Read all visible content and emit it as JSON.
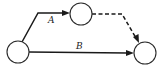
{
  "diagram": {
    "type": "network",
    "colors": {
      "stroke": "#1a1a1a",
      "background": "#ffffff"
    },
    "nodes": [
      {
        "id": "start",
        "cx": 18,
        "cy": 52,
        "r": 11
      },
      {
        "id": "mid",
        "cx": 81,
        "cy": 14,
        "r": 11
      },
      {
        "id": "end",
        "cx": 145,
        "cy": 53,
        "r": 11
      }
    ],
    "edges": [
      {
        "id": "A",
        "label": "A",
        "from": "start",
        "to": "mid",
        "style": "solid"
      },
      {
        "id": "dummy",
        "label": "",
        "from": "mid",
        "to": "end",
        "style": "dashed"
      },
      {
        "id": "B",
        "label": "B",
        "from": "start",
        "to": "end",
        "style": "solid"
      }
    ]
  },
  "labels": {
    "edge_a": "A",
    "edge_b": "B"
  }
}
